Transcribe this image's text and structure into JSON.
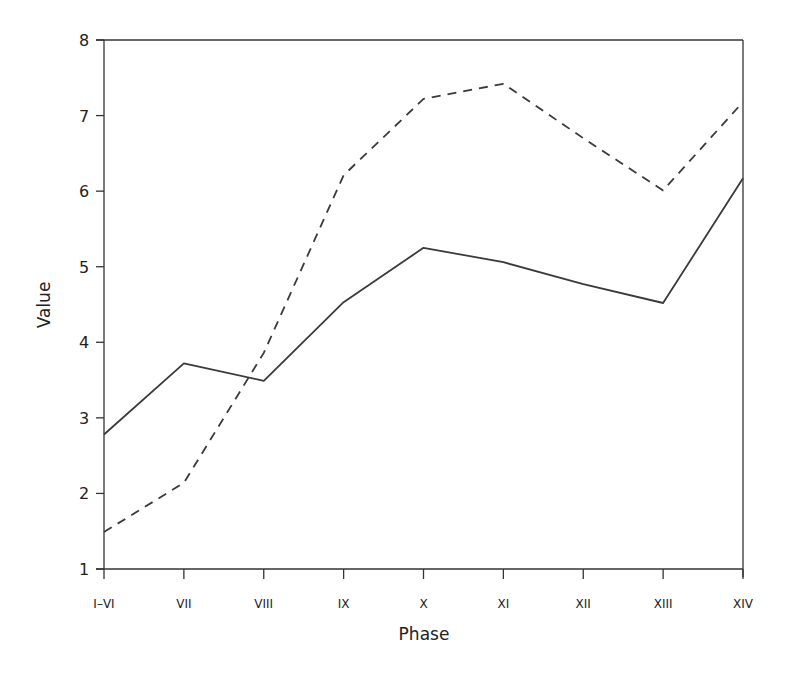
{
  "chart_data": {
    "type": "line",
    "title": "",
    "xlabel": "Phase",
    "ylabel": "Value",
    "categories": [
      "I–VI",
      "VII",
      "VIII",
      "IX",
      "X",
      "XI",
      "XII",
      "XIII",
      "XIV"
    ],
    "ylim": [
      1,
      8
    ],
    "yticks": [
      1,
      2,
      3,
      4,
      5,
      6,
      7,
      8
    ],
    "grid": false,
    "legend": "none",
    "series": [
      {
        "name": "solid",
        "style": "solid",
        "values": [
          2.78,
          3.72,
          3.49,
          4.53,
          5.25,
          5.06,
          4.77,
          4.52,
          6.17
        ]
      },
      {
        "name": "dashed",
        "style": "dashed",
        "values": [
          1.49,
          2.14,
          3.86,
          6.21,
          7.22,
          7.42,
          6.7,
          6.01,
          7.18
        ]
      }
    ]
  }
}
